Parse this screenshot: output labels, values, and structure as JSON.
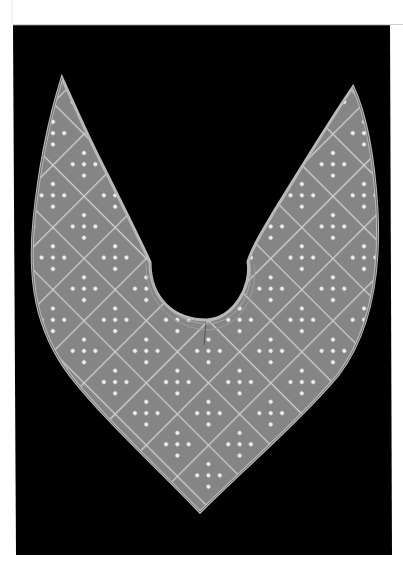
{
  "image": {
    "description": "Quilted textile collar with diamond lattice and dot pattern, photographed on black background",
    "colors": {
      "page": "#ffffff",
      "backdrop": "#000000",
      "fabric": "#858585",
      "fabric_edge": "#b9b9b9",
      "stitch": "#d6d6d6",
      "dot": "#f2f2f2"
    }
  }
}
